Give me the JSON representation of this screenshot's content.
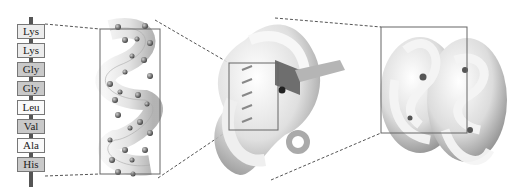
{
  "figure": {
    "primary_structure": {
      "residues": [
        {
          "label": "Lys",
          "shade": "light"
        },
        {
          "label": "Lys",
          "shade": "light"
        },
        {
          "label": "Gly",
          "shade": "gray"
        },
        {
          "label": "Gly",
          "shade": "gray"
        },
        {
          "label": "Leu",
          "shade": "white"
        },
        {
          "label": "Val",
          "shade": "gray"
        },
        {
          "label": "Ala",
          "shade": "white"
        },
        {
          "label": "His",
          "shade": "gray"
        }
      ]
    },
    "panels": [
      {
        "name": "secondary-structure-helix",
        "box": {
          "x": 100,
          "y": 29,
          "w": 60,
          "h": 145
        }
      },
      {
        "name": "tertiary-structure",
        "box": {
          "x": 229,
          "y": 63,
          "w": 49,
          "h": 67
        }
      },
      {
        "name": "quaternary-structure",
        "box": {
          "x": 381,
          "y": 27,
          "w": 86,
          "h": 106
        }
      }
    ],
    "colors": {
      "line": "#555555",
      "box_border": "#666666",
      "ribbon": "#d8d8d8",
      "shadow": "#8a8a8a"
    }
  }
}
